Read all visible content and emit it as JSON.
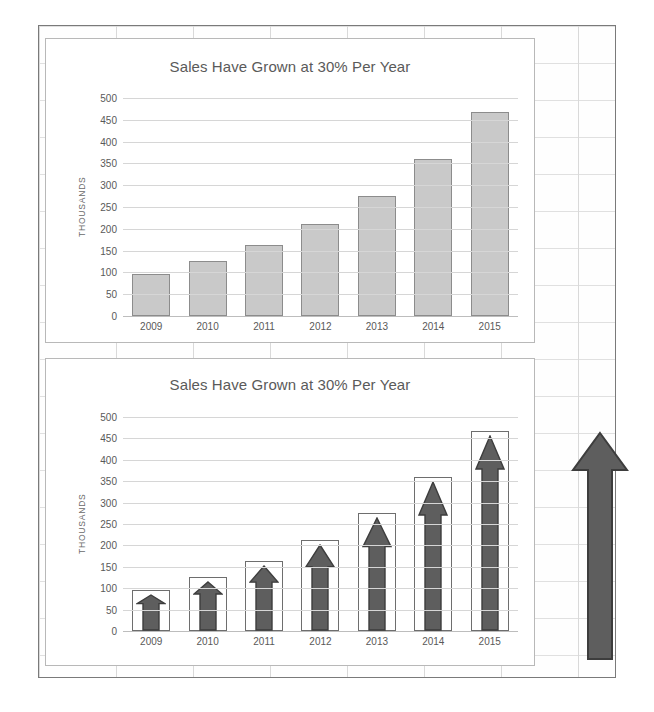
{
  "document": {
    "kind": "spreadsheet-chart-sheet"
  },
  "colors": {
    "bar_fill_top": "#c9c9c9",
    "bar_stroke_top": "#8c8c8c",
    "bar_fill_bottom": "#ffffff",
    "bar_stroke_bottom": "#6e6e6e",
    "arrow_fill": "#5e5e5e",
    "arrow_stroke": "#3d3d3d",
    "title_color": "#5a5a5a",
    "grid_color": "#d6d6d6",
    "sheet_border": "#7a7a7a"
  },
  "charts": [
    {
      "id": "chart-plain-bars",
      "title": "Sales Have Grown at 30% Per Year",
      "ylabel": "THOUSANDS",
      "style": "plain-bars"
    },
    {
      "id": "chart-arrow-bars",
      "title": "Sales Have Grown at 30% Per Year",
      "ylabel": "THOUSANDS",
      "style": "arrow-bars"
    }
  ],
  "yticks": [
    "500",
    "450",
    "400",
    "350",
    "300",
    "250",
    "200",
    "150",
    "100",
    "50",
    "0"
  ],
  "standalone_arrow": {
    "label": "up-arrow-shape",
    "direction": "up"
  },
  "chart_data": [
    {
      "type": "bar",
      "title": "Sales Have Grown at 30% Per Year",
      "xlabel": "",
      "ylabel": "THOUSANDS",
      "categories": [
        "2009",
        "2010",
        "2011",
        "2012",
        "2013",
        "2014",
        "2015"
      ],
      "values": [
        96,
        125,
        163,
        212,
        276,
        359,
        467
      ],
      "ylim": [
        0,
        500
      ],
      "ytick_step": 50,
      "grid": true,
      "legend": false,
      "series_style": "solid-grey-bars"
    },
    {
      "type": "bar",
      "title": "Sales Have Grown at 30% Per Year",
      "xlabel": "",
      "ylabel": "THOUSANDS",
      "categories": [
        "2009",
        "2010",
        "2011",
        "2012",
        "2013",
        "2014",
        "2015"
      ],
      "values": [
        96,
        125,
        163,
        212,
        276,
        359,
        467
      ],
      "ylim": [
        0,
        500
      ],
      "ytick_step": 50,
      "grid": true,
      "legend": false,
      "series_style": "hollow-bars-with-up-arrow-fill"
    }
  ]
}
